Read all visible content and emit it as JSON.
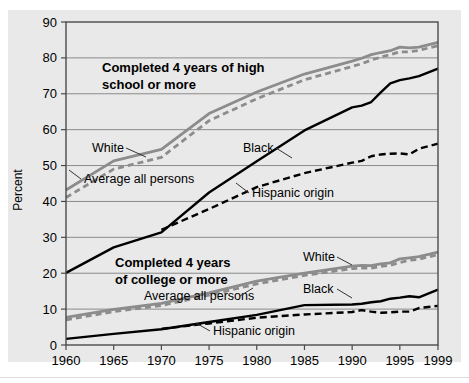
{
  "chart_data": {
    "type": "line",
    "title": "",
    "xlabel": "",
    "ylabel": "Percent",
    "xlim": [
      1960,
      1999
    ],
    "ylim": [
      0,
      90
    ],
    "yticks": [
      0,
      10,
      20,
      30,
      40,
      50,
      60,
      70,
      80,
      90
    ],
    "xticks": [
      1960,
      1965,
      1970,
      1975,
      1980,
      1985,
      1990,
      1995,
      1999
    ],
    "grid": true,
    "legend_position": "inline-callouts",
    "group_labels": {
      "upper": "Completed 4 years of high school or more",
      "upper_line1": "Completed 4 years of high",
      "upper_line2": "school or more",
      "lower": "Completed 4 years of college or more",
      "lower_line1": "Completed 4 years",
      "lower_line2": "of college or more"
    },
    "colors": {
      "white_series": "#8c8c8c",
      "average_series": "#8c8c8c",
      "black_series": "#000000",
      "hispanic_series": "#000000",
      "grid": "#8a8a8a",
      "panel": "#e9e9e9",
      "frame": "#4a4a4a"
    },
    "x": [
      1960,
      1965,
      1970,
      1975,
      1980,
      1985,
      1990,
      1991,
      1992,
      1993,
      1994,
      1995,
      1996,
      1997,
      1999
    ],
    "series": [
      {
        "name": "White",
        "group": "high school",
        "style": "solid",
        "color": "#8c8c8c",
        "values": [
          43.2,
          51.3,
          54.5,
          64.5,
          70.5,
          75.5,
          79.1,
          79.9,
          80.9,
          81.5,
          82.0,
          83.0,
          82.8,
          83.0,
          84.3
        ]
      },
      {
        "name": "Average all persons",
        "group": "high school",
        "style": "dashed",
        "color": "#8c8c8c",
        "values": [
          41.1,
          49.0,
          52.3,
          62.5,
          68.6,
          73.9,
          77.6,
          78.4,
          79.4,
          80.2,
          80.9,
          81.7,
          81.7,
          82.1,
          83.4
        ]
      },
      {
        "name": "Black",
        "group": "high school",
        "style": "solid",
        "color": "#000000",
        "values": [
          20.1,
          27.2,
          31.4,
          42.5,
          51.2,
          59.8,
          66.2,
          66.7,
          67.7,
          70.4,
          72.9,
          73.8,
          74.3,
          74.9,
          77.0
        ]
      },
      {
        "name": "Hispanic origin",
        "group": "high school",
        "style": "dashed",
        "color": "#000000",
        "values": [
          null,
          null,
          32.1,
          37.9,
          44.0,
          47.9,
          50.8,
          51.3,
          52.6,
          53.1,
          53.3,
          53.4,
          53.1,
          54.7,
          56.1
        ]
      },
      {
        "name": "White",
        "group": "college",
        "style": "solid",
        "color": "#8c8c8c",
        "values": [
          7.7,
          9.9,
          11.6,
          14.5,
          17.8,
          20.0,
          22.0,
          22.2,
          22.1,
          22.6,
          22.9,
          24.0,
          24.3,
          24.6,
          25.9
        ]
      },
      {
        "name": "Average all persons",
        "group": "college",
        "style": "dashed",
        "color": "#8c8c8c",
        "values": [
          7.0,
          9.3,
          11.0,
          13.9,
          17.0,
          19.4,
          21.3,
          21.4,
          21.4,
          21.9,
          22.2,
          23.0,
          23.6,
          23.9,
          25.2
        ]
      },
      {
        "name": "Black",
        "group": "college",
        "style": "solid",
        "color": "#000000",
        "values": [
          1.7,
          3.1,
          4.4,
          6.4,
          8.4,
          11.1,
          11.3,
          11.5,
          11.9,
          12.2,
          12.9,
          13.2,
          13.6,
          13.3,
          15.4
        ]
      },
      {
        "name": "Hispanic origin",
        "group": "college",
        "style": "dashed",
        "color": "#000000",
        "values": [
          null,
          null,
          4.5,
          6.0,
          7.6,
          8.5,
          9.2,
          9.7,
          9.3,
          9.0,
          9.1,
          9.3,
          9.3,
          10.3,
          10.9
        ]
      }
    ],
    "annotations": [
      {
        "text": "White",
        "group": "high school"
      },
      {
        "text": "Average all persons",
        "group": "high school"
      },
      {
        "text": "Black",
        "group": "high school"
      },
      {
        "text": "Hispanic origin",
        "group": "high school"
      },
      {
        "text": "White",
        "group": "college"
      },
      {
        "text": "Average all persons",
        "group": "college"
      },
      {
        "text": "Black",
        "group": "college"
      },
      {
        "text": "Hispanic origin",
        "group": "college"
      }
    ]
  },
  "axis": {
    "ylabel": "Percent",
    "yticks": [
      "90",
      "80",
      "70",
      "60",
      "50",
      "40",
      "30",
      "20",
      "10",
      "0"
    ],
    "xticks": [
      "1960",
      "1965",
      "1970",
      "1975",
      "1980",
      "1985",
      "1990",
      "1995",
      "1999"
    ]
  },
  "labels": {
    "hs_title_1": "Completed 4 years of high",
    "hs_title_2": "school or more",
    "col_title_1": "Completed 4 years",
    "col_title_2": "of college or more",
    "hs_white": "White",
    "hs_average": "Average all persons",
    "hs_black": "Black",
    "hs_hispanic": "Hispanic origin",
    "col_white": "White",
    "col_average": "Average all persons",
    "col_black": "Black",
    "col_hispanic": "Hispanic origin"
  }
}
